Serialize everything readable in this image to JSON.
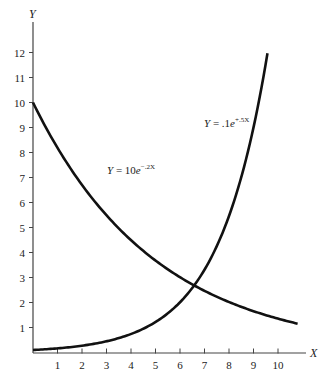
{
  "chart_data": {
    "type": "line",
    "title": "",
    "xlabel": "X",
    "ylabel": "Y",
    "xlim": [
      0,
      11
    ],
    "ylim": [
      0,
      13
    ],
    "grid": false,
    "legend": "none (inline curve labels)",
    "x_ticks": [
      "1",
      "2",
      "3",
      "4",
      "5",
      "6",
      "7",
      "8",
      "9",
      "10"
    ],
    "y_ticks": [
      "1",
      "2",
      "3",
      "4",
      "5",
      "6",
      "7",
      "8",
      "9",
      "10",
      "11",
      "12"
    ],
    "series": [
      {
        "name": "Y = 10e^{-.2X}",
        "label_main": "Y = 10e",
        "label_exp": "−.2X",
        "x": [
          0,
          1,
          2,
          3,
          4,
          5,
          6,
          7,
          8,
          9,
          10,
          10.8
        ],
        "values": [
          10,
          8.19,
          6.7,
          5.49,
          4.49,
          3.68,
          3.01,
          2.47,
          2.02,
          1.65,
          1.35,
          1.15
        ]
      },
      {
        "name": "Y = .1e^{+.5X}",
        "label_main": "Y = .1e",
        "label_exp": "+.5X",
        "x": [
          0,
          1,
          2,
          3,
          4,
          5,
          6,
          7,
          8,
          9,
          9.57
        ],
        "values": [
          0.1,
          0.16,
          0.27,
          0.45,
          0.74,
          1.22,
          2.01,
          3.31,
          5.46,
          9.0,
          11.95
        ]
      }
    ],
    "annotations": [
      {
        "text": "Y = 10e^{-.2X}",
        "near": [
          3,
          7
        ]
      },
      {
        "text": "Y = .1e^{+.5X}",
        "near": [
          8.5,
          9.2
        ]
      }
    ]
  }
}
